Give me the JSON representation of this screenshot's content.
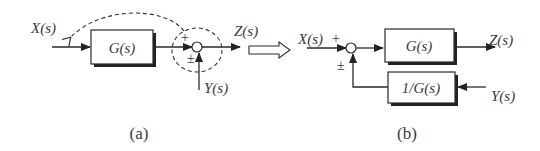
{
  "panel_a": {
    "caption": "(a)",
    "input_label": "X(s)",
    "output_label": "Z(s)",
    "disturbance_label": "Y(s)",
    "block_label": "G(s)",
    "sum_sign_top": "+",
    "sum_sign_bottom": "±"
  },
  "transform_arrow": "hollow-right-arrow",
  "panel_b": {
    "caption": "(b)",
    "input_label": "X(s)",
    "input_sign": "+",
    "output_label": "Z(s)",
    "disturbance_label": "Y(s)",
    "forward_block_label": "G(s)",
    "feedback_block_label": "1/G(s)",
    "sum_sign_bottom": "±"
  },
  "colors": {
    "line": "#2a2a2a",
    "text": "#3a3a3a",
    "background": "#ffffff"
  }
}
